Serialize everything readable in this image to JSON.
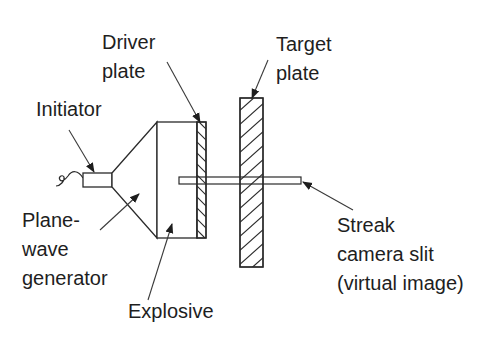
{
  "diagram": {
    "type": "schematic",
    "colors": {
      "ink": "#2a2a2a",
      "text": "#1e1e1e",
      "background": "#ffffff"
    },
    "labels": {
      "driver_plate": [
        "Driver",
        "plate"
      ],
      "target_plate": [
        "Target",
        "plate"
      ],
      "initiator": [
        "Initiator"
      ],
      "plane_wave_generator": [
        "Plane-",
        "wave",
        "generator"
      ],
      "explosive": [
        "Explosive"
      ],
      "streak_camera_slit": [
        "Streak",
        "camera slit",
        "(virtual image)"
      ]
    },
    "components": [
      {
        "name": "Initiator",
        "shape": "rectangle with detonator wire"
      },
      {
        "name": "Plane-wave generator",
        "shape": "truncated cone"
      },
      {
        "name": "Explosive",
        "shape": "rectangle"
      },
      {
        "name": "Driver plate",
        "shape": "hatched thin rectangle"
      },
      {
        "name": "Target plate",
        "shape": "hatched rectangle"
      },
      {
        "name": "Streak camera slit (virtual image)",
        "shape": "thin horizontal bar"
      }
    ]
  }
}
